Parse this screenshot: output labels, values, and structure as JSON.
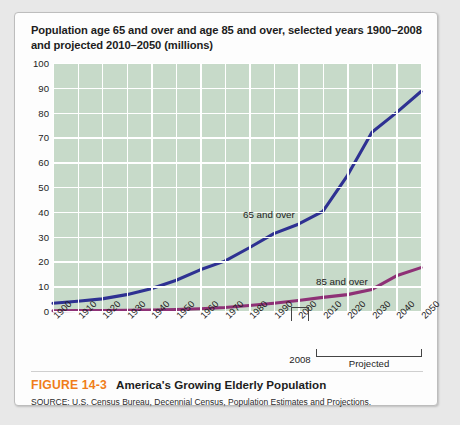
{
  "figure": {
    "number": "FIGURE 14-3",
    "title": "America's Growing Elderly Population",
    "source": "SOURCE: U.S. Census Bureau, Decennial Census, Population Estimates and Projections."
  },
  "annotations": {
    "year_marker": "2008",
    "projected_label": "Projected"
  },
  "colors": {
    "series_65": "#2e3192",
    "series_85": "#8e3176",
    "plot_background": "#c7dac9",
    "gridline": "#ffffff",
    "figure_number": "#f07d1a",
    "card_background": "#fdfdfd",
    "page_background": "#e8e8e8"
  },
  "chart_data": {
    "type": "line",
    "title": "Population age 65 and over and age 85 and over, selected years 1900–2008 and projected 2010–2050 (millions)",
    "xlabel": "",
    "ylabel": "",
    "ylim": [
      0,
      100
    ],
    "yticks": [
      0,
      10,
      20,
      30,
      40,
      50,
      60,
      70,
      80,
      90,
      100
    ],
    "categories": [
      1900,
      1910,
      1920,
      1930,
      1940,
      1950,
      1960,
      1970,
      1980,
      1990,
      2000,
      2010,
      2020,
      2030,
      2040,
      2050
    ],
    "x": [
      "1900",
      "1910",
      "1920",
      "1930",
      "1940",
      "1950",
      "1960",
      "1970",
      "1980",
      "1990",
      "2000",
      "2010",
      "2020",
      "2030",
      "2040",
      "2050"
    ],
    "grid": true,
    "legend_position": "inline-labels",
    "series": [
      {
        "name": "65 and over",
        "color": "#2e3192",
        "values": [
          3.1,
          3.9,
          4.9,
          6.6,
          9.0,
          12.3,
          16.6,
          20.1,
          25.5,
          31.2,
          35.0,
          40.2,
          54.6,
          72.1,
          80.0,
          88.5
        ]
      },
      {
        "name": "85 and over",
        "color": "#8e3176",
        "values": [
          0.1,
          0.2,
          0.2,
          0.3,
          0.4,
          0.6,
          0.9,
          1.4,
          2.2,
          3.1,
          4.2,
          5.5,
          6.6,
          8.7,
          14.2,
          17.5
        ]
      }
    ]
  }
}
